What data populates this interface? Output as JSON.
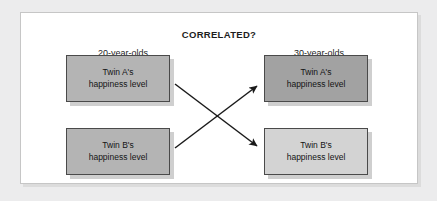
{
  "figure": {
    "title": "CORRELATED?",
    "background_color": "#ececed",
    "panel_color": "#ffffff",
    "panel_border_color": "#c6c6c6"
  },
  "columns": [
    {
      "id": "left",
      "label": "20-year-olds"
    },
    {
      "id": "right",
      "label": "30-year-olds"
    }
  ],
  "nodes": [
    {
      "id": "left-twin-a",
      "label": "Twin A's\nhappiness level",
      "fill": "#b4b4b4",
      "border": "#4a4a4a",
      "x": 66,
      "y": 55,
      "w": 104,
      "h": 47
    },
    {
      "id": "left-twin-b",
      "label": "Twin B's\nhappiness level",
      "fill": "#b4b4b4",
      "border": "#4a4a4a",
      "x": 66,
      "y": 128,
      "w": 104,
      "h": 47
    },
    {
      "id": "right-twin-a",
      "label": "Twin A's\nhappiness level",
      "fill": "#a2a2a2",
      "border": "#4a4a4a",
      "x": 264,
      "y": 55,
      "w": 104,
      "h": 47
    },
    {
      "id": "right-twin-b",
      "label": "Twin B's\nhappiness level",
      "fill": "#d3d3d3",
      "border": "#4a4a4a",
      "x": 264,
      "y": 128,
      "w": 104,
      "h": 47
    }
  ],
  "arrows": [
    {
      "id": "arrow-left-a-to-right-b",
      "from": "left-twin-a",
      "to": "right-twin-b",
      "color": "#1a1a1a",
      "x1": 175,
      "y1": 84,
      "x2": 259,
      "y2": 148,
      "arrowhead_at": "end"
    },
    {
      "id": "arrow-left-b-to-right-a",
      "from": "left-twin-b",
      "to": "right-twin-a",
      "color": "#1a1a1a",
      "x1": 175,
      "y1": 148,
      "x2": 259,
      "y2": 84,
      "arrowhead_at": "end"
    }
  ]
}
